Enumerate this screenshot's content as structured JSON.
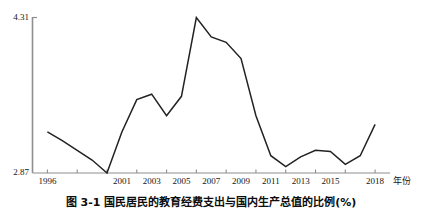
{
  "figure": {
    "caption": "图 3-1  国民居民的教育经费支出与国内生产总值的比例(%)"
  },
  "chart_data": {
    "type": "line",
    "title": "",
    "subtitle": "",
    "xlabel": "年份",
    "ylabel": "",
    "grid": false,
    "legend": null,
    "line_color": "#222222",
    "axis_color": "#888888",
    "background": "#ffffff",
    "ylim": [
      2.87,
      4.31
    ],
    "ytick_labels": [
      "4.31",
      "2.87"
    ],
    "ytick_values": [
      4.31,
      2.87
    ],
    "xlim": [
      1995,
      2019
    ],
    "xtick_labels": [
      "1996",
      "2001",
      "2003",
      "2005",
      "2007",
      "2009",
      "2011",
      "2013",
      "2015",
      "2018"
    ],
    "xtick_values": [
      1996,
      2001,
      2003,
      2005,
      2007,
      2009,
      2011,
      2013,
      2015,
      2018
    ],
    "x": [
      1996,
      1997,
      1998,
      1999,
      2000,
      2001,
      2002,
      2003,
      2004,
      2005,
      2006,
      2007,
      2008,
      2009,
      2010,
      2011,
      2012,
      2013,
      2014,
      2015,
      2016,
      2017,
      2018
    ],
    "values": [
      3.25,
      3.17,
      3.08,
      2.99,
      2.87,
      3.25,
      3.55,
      3.6,
      3.4,
      3.58,
      4.31,
      4.13,
      4.08,
      3.93,
      3.4,
      3.03,
      2.93,
      3.02,
      3.08,
      3.07,
      2.95,
      3.03,
      3.32
    ],
    "series": [
      {
        "name": "教育经费支出占国内生产总值比例",
        "values": [
          3.25,
          3.17,
          3.08,
          2.99,
          2.87,
          3.25,
          3.55,
          3.6,
          3.4,
          3.58,
          4.31,
          4.13,
          4.08,
          3.93,
          3.4,
          3.03,
          2.93,
          3.02,
          3.08,
          3.07,
          2.95,
          3.03,
          3.32
        ]
      }
    ]
  }
}
